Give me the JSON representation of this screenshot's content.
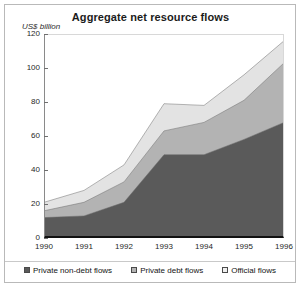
{
  "chart_data": {
    "type": "area",
    "title": "Aggregate net resource flows",
    "subtitle": "",
    "xlabel": "",
    "ylabel": "US$ billion",
    "ylim": [
      0,
      120
    ],
    "yticks": [
      0,
      20,
      40,
      60,
      80,
      100,
      120
    ],
    "grid": false,
    "stacked": true,
    "legend_position": "bottom",
    "categories": [
      "1990",
      "1991",
      "1992",
      "1993",
      "1994",
      "1995",
      "1996"
    ],
    "x": [
      1990,
      1991,
      1992,
      1993,
      1994,
      1995,
      1996
    ],
    "series": [
      {
        "name": "Private non-debt flows",
        "color": "#5a5a5a",
        "values": [
          12,
          13,
          21,
          49,
          49,
          58,
          68
        ]
      },
      {
        "name": "Private debt flows",
        "color": "#b3b3b3",
        "values": [
          4,
          8,
          12,
          14,
          19,
          23,
          35
        ]
      },
      {
        "name": "Official flows",
        "color": "#e3e3e3",
        "values": [
          5,
          7,
          10,
          16,
          10,
          15,
          13
        ]
      }
    ],
    "cumulative_tops": {
      "private_non_debt": [
        12,
        13,
        21,
        49,
        49,
        58,
        68
      ],
      "plus_private_debt": [
        16,
        21,
        33,
        63,
        68,
        81,
        103
      ],
      "total": [
        21,
        28,
        43,
        79,
        78,
        96,
        116
      ]
    }
  },
  "chart": {
    "title": "Aggregate net resource flows",
    "y_axis_label": "US$ billion",
    "y_tick_labels": [
      "120",
      "100",
      "80",
      "60",
      "40",
      "20",
      "0"
    ],
    "x_tick_labels": [
      "1990",
      "1991",
      "1992",
      "1993",
      "1994",
      "1995",
      "1996"
    ]
  },
  "legend": {
    "items": [
      {
        "label": "Private non-debt flows",
        "color": "#5a5a5a"
      },
      {
        "label": "Private debt flows",
        "color": "#b3b3b3"
      },
      {
        "label": "Official flows",
        "color": "#efefef"
      }
    ]
  },
  "colors": {
    "series_dark": "#5a5a5a",
    "series_mid": "#b3b3b3",
    "series_light": "#e3e3e3",
    "axis": "#111111",
    "frame": "#b9b9b9",
    "background": "#ffffff",
    "text": "#1b1b1b"
  }
}
